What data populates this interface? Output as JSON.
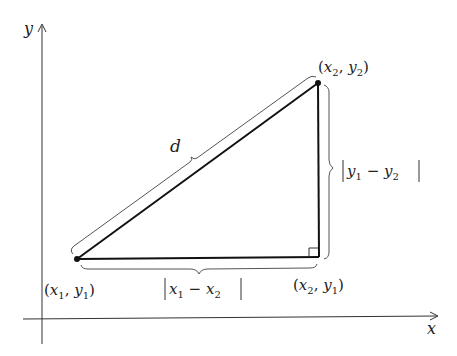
{
  "diagram": {
    "axes": {
      "x_label": "x",
      "y_label": "y"
    },
    "points": {
      "p1": {
        "label_open": "(",
        "x": "x",
        "xs": "1",
        "sep": ", ",
        "y": "y",
        "ys": "1",
        "label_close": ")"
      },
      "p2": {
        "label_open": "(",
        "x": "x",
        "xs": "2",
        "sep": ", ",
        "y": "y",
        "ys": "2",
        "label_close": ")"
      },
      "p3": {
        "label_open": "(",
        "x": "x",
        "xs": "2",
        "sep": ", ",
        "y": "y",
        "ys": "1",
        "label_close": ")"
      }
    },
    "hypotenuse_label": "d",
    "horizontal_leg": {
      "a": "x",
      "as": "1",
      "minus": " − ",
      "b": "x",
      "bs": "2"
    },
    "vertical_leg": {
      "a": "y",
      "as": "1",
      "minus": " − ",
      "b": "y",
      "bs": "2"
    },
    "colors": {
      "line": "#111111",
      "brace": "#555555",
      "axis": "#333333"
    }
  }
}
